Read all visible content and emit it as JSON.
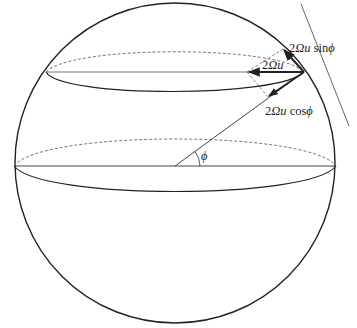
{
  "figure": {
    "labels": {
      "horizontal_component": {
        "prefix": "2",
        "omega": "Ω",
        "u": "u",
        "fn": " sin",
        "angle": "ϕ"
      },
      "total": {
        "prefix": "2",
        "omega": "Ω",
        "u": "u"
      },
      "vertical_component": {
        "prefix": "2",
        "omega": "Ω",
        "u": "u",
        "fn": " cos",
        "angle": "ϕ"
      },
      "latitude_angle": "ϕ"
    },
    "colors": {
      "ink": "#222222",
      "thin_line": "#555555",
      "dashed": "#666666"
    }
  }
}
